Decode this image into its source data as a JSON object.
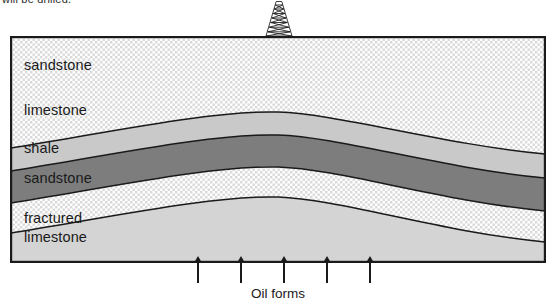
{
  "top_caption": {
    "text": "will be drilled."
  },
  "derrick": {
    "icon": "drilling-derrick-icon"
  },
  "cross_section": {
    "border_color": "#1a1a1a",
    "layers": [
      {
        "id": "sandstone-upper",
        "label": "sandstone",
        "rock_type": "sandstone",
        "fill": "#ffffff",
        "pattern": "stipple-dots",
        "order": 1
      },
      {
        "id": "limestone",
        "label": "limestone",
        "rock_type": "limestone",
        "fill": "#c9c9c9",
        "pattern": "solid",
        "order": 2
      },
      {
        "id": "shale",
        "label": "shale",
        "rock_type": "shale",
        "fill": "#7d7d7d",
        "pattern": "solid",
        "order": 3
      },
      {
        "id": "sandstone-lower",
        "label": "sandstone",
        "rock_type": "sandstone",
        "fill": "#ffffff",
        "pattern": "stipple-dots",
        "order": 4
      },
      {
        "id": "fractured-limestone",
        "label_line1": "fractured",
        "label_line2": "limestone",
        "rock_type": "fractured limestone",
        "fill": "#d4d4d4",
        "pattern": "solid",
        "order": 5
      }
    ]
  },
  "arrows": {
    "count": 5,
    "direction": "up",
    "color": "#1a1a1a",
    "label": "oil-migration-arrow"
  },
  "bottom_caption": {
    "text": "Oil forms"
  }
}
